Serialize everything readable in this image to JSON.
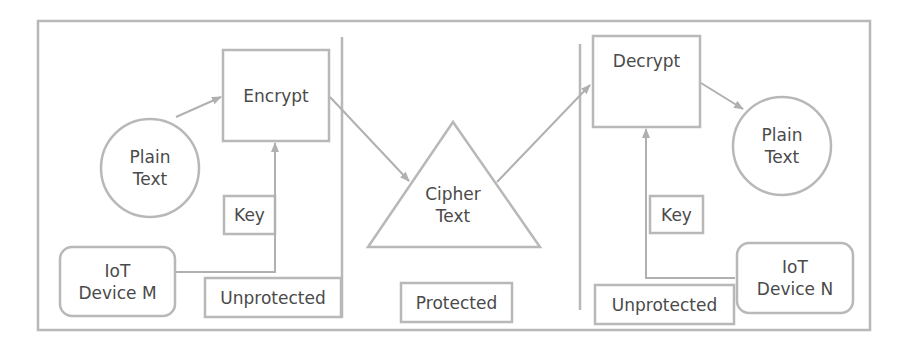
{
  "diagram": {
    "colors": {
      "stroke": "#b5b5b5",
      "text": "#4a4a4a",
      "background": "#ffffff"
    },
    "sender": {
      "plain_text": "Plain\nText",
      "encrypt": "Encrypt",
      "key": "Key",
      "device": "IoT\nDevice M",
      "zone": "Unprotected"
    },
    "channel": {
      "cipher_text": "Cipher\nText",
      "zone": "Protected"
    },
    "receiver": {
      "decrypt": "Decrypt",
      "plain_text": "Plain\nText",
      "key": "Key",
      "device": "IoT\nDevice N",
      "zone": "Unprotected"
    }
  }
}
